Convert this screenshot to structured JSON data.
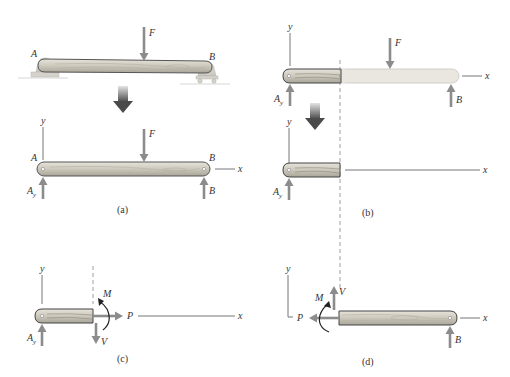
{
  "figure": {
    "colors": {
      "wood": "#cfcbbf",
      "wood_dark": "#a8a497",
      "wood_outline": "#555555",
      "force": "#8c8c8c",
      "support": "#d8d6cf",
      "ghost_beam": "#e8e6df",
      "transition_arrow_top": "#dddddd",
      "transition_arrow_bottom": "#555555"
    }
  },
  "panels": {
    "a": {
      "caption": "(a)",
      "top": {
        "point_a": "A",
        "point_b": "B",
        "load": "F"
      },
      "fbd": {
        "axis_y": "y",
        "axis_x": "x",
        "point_a": "A",
        "point_b": "B",
        "load": "F",
        "reaction_a": "A",
        "reaction_a_sub": "y",
        "reaction_b": "B"
      }
    },
    "b": {
      "caption": "(b)",
      "top": {
        "axis_y": "y",
        "axis_x": "x",
        "load": "F",
        "reaction_a": "A",
        "reaction_a_sub": "y",
        "reaction_b": "B"
      },
      "bottom": {
        "axis_y": "y",
        "axis_x": "x",
        "reaction_a": "A",
        "reaction_a_sub": "y"
      }
    },
    "c": {
      "caption": "(c)",
      "axis_y": "y",
      "axis_x": "x",
      "reaction_a": "A",
      "reaction_a_sub": "y",
      "moment": "M",
      "normal": "P",
      "shear": "V"
    },
    "d": {
      "caption": "(d)",
      "axis_y": "y",
      "axis_x": "x",
      "moment": "M",
      "normal": "P",
      "shear": "V",
      "reaction_b": "B"
    }
  }
}
